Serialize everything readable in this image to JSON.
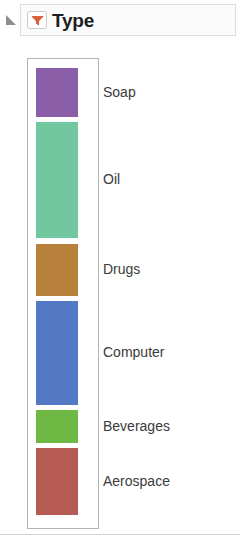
{
  "header": {
    "title": "Type",
    "collapse_icon": "collapse-triangle-icon",
    "filter_icon": "filter-funnel-icon",
    "filter_icon_color": "#E05A32",
    "collapse_icon_color": "#8a8a8a"
  },
  "legend": {
    "items": [
      {
        "label": "Soap",
        "color": "#8B5FA8",
        "top": 9,
        "height": 49
      },
      {
        "label": "Oil",
        "color": "#72C6A0",
        "height": 116,
        "top": 63
      },
      {
        "label": "Drugs",
        "color": "#B8813B",
        "top": 185,
        "height": 52
      },
      {
        "label": "Computer",
        "color": "#5378C4",
        "top": 242,
        "height": 104
      },
      {
        "label": "Beverages",
        "color": "#6DB944",
        "top": 351,
        "height": 33
      },
      {
        "label": "Aerospace",
        "color": "#B65A54",
        "top": 389,
        "height": 67
      }
    ]
  }
}
